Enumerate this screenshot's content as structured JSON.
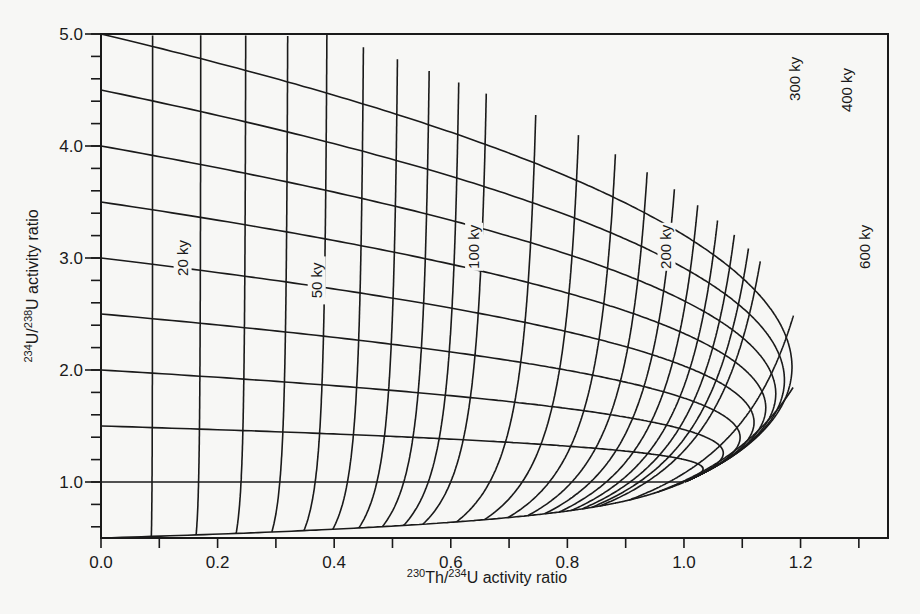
{
  "chart_data": {
    "type": "line",
    "title": "",
    "xlabel": "230Th/234U activity ratio",
    "xlabel_parts": {
      "sup1": "230",
      "t1": "Th/",
      "sup2": "234",
      "t2": "U activity ratio"
    },
    "ylabel": "234U/238U activity ratio",
    "ylabel_parts": {
      "sup1": "234",
      "t1": "U/",
      "sup2": "238",
      "t2": "U activity ratio"
    },
    "xlim": [
      0.0,
      1.35
    ],
    "ylim": [
      0.5,
      5.0
    ],
    "grid": false,
    "legend": "none",
    "x_ticks": {
      "major": [
        0.0,
        0.2,
        0.4,
        0.6,
        0.8,
        1.0,
        1.2
      ],
      "minor_step": 0.1,
      "labels": [
        "0.0",
        "0.2",
        "0.4",
        "0.6",
        "0.8",
        "1.0",
        "1.2"
      ]
    },
    "y_ticks": {
      "major": [
        1.0,
        2.0,
        3.0,
        4.0,
        5.0
      ],
      "minor_step": 0.2,
      "labels": [
        "1.0",
        "2.0",
        "3.0",
        "4.0",
        "5.0"
      ]
    },
    "model": {
      "description": "Closed-system evolution of 234U/238U vs 230Th/234U activity ratios",
      "lambda_230_per_ky": 0.009158,
      "lambda_234_per_ky": 0.002826
    },
    "initial_ratio_curves": [
      5.0,
      4.5,
      4.0,
      3.5,
      3.0,
      2.5,
      2.0,
      1.5,
      1.0,
      0.5
    ],
    "isochron_ages_ky": [
      10,
      20,
      30,
      40,
      50,
      60,
      70,
      80,
      90,
      100,
      120,
      140,
      160,
      180,
      200,
      220,
      240,
      260,
      280,
      300,
      400,
      600
    ],
    "isochron_labels": [
      {
        "age": 20,
        "text": "20 ky",
        "x": 0.14,
        "y": 3.0
      },
      {
        "age": 50,
        "text": "50 ky",
        "x": 0.37,
        "y": 2.8
      },
      {
        "age": 100,
        "text": "100 ky",
        "x": 0.64,
        "y": 3.1
      },
      {
        "age": 200,
        "text": "200 ky",
        "x": 0.97,
        "y": 3.1
      },
      {
        "age": 300,
        "text": "300 ky",
        "x": 1.19,
        "y": 4.6
      },
      {
        "age": 400,
        "text": "400 ky",
        "x": 1.28,
        "y": 4.5
      },
      {
        "age": 600,
        "text": "600 ky",
        "x": 1.31,
        "y": 3.1
      }
    ],
    "series_samples": [
      {
        "name": "initial 5.0",
        "x": [
          0.0,
          0.09,
          0.17,
          0.37,
          0.66,
          0.98,
          1.19,
          1.32
        ],
        "y": [
          5.0,
          4.86,
          4.72,
          4.31,
          4.02,
          3.26,
          2.61,
          1.85
        ]
      },
      {
        "name": "initial 1.0",
        "x": [
          0.0,
          0.5,
          1.0
        ],
        "y": [
          1.0,
          1.0,
          1.0
        ]
      },
      {
        "name": "isochron 100 ky",
        "x": [
          0.66,
          0.64,
          0.62,
          0.6,
          0.58,
          0.55
        ],
        "y": [
          5.0,
          4.0,
          3.0,
          2.0,
          1.0,
          0.5
        ]
      }
    ]
  },
  "style": {
    "line_color": "#1a1a1a",
    "background": "#f7f7f5"
  }
}
